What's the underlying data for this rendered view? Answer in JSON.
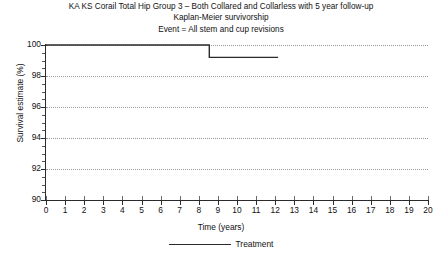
{
  "title": {
    "line1": "KA KS Corail Total Hip Group 3 – Both Collared and Collarless with 5 year follow-up",
    "line2": "Kaplan-Meier survivorship",
    "line3": "Event = All stem and cup revisions"
  },
  "legend": {
    "series_label": "Treatment"
  },
  "colors": {
    "curve": "#2b2b2b",
    "axis": "#2b2b2b",
    "grid": "#9a9a9a",
    "text": "#111111",
    "background": "#ffffff"
  },
  "chart_data": {
    "type": "line",
    "xlabel": "Time (years)",
    "ylabel": "Survival estimate (%)",
    "xlim": [
      0,
      20
    ],
    "ylim": [
      90,
      100
    ],
    "xticks": [
      0,
      1,
      2,
      3,
      4,
      5,
      6,
      7,
      8,
      9,
      10,
      11,
      12,
      13,
      14,
      15,
      16,
      17,
      18,
      19,
      20
    ],
    "xtick_labels": [
      "0",
      "1",
      "2",
      "3",
      "4",
      "5",
      "6",
      "7",
      "8",
      "9",
      "10",
      "11",
      "12",
      "13",
      "14",
      "15",
      "16",
      "17",
      "18",
      "19",
      "20"
    ],
    "yticks": [
      90,
      92,
      94,
      96,
      98,
      100
    ],
    "ytick_labels": [
      "90",
      "92",
      "94",
      "96",
      "98",
      "100"
    ],
    "y_minor_tick_step": 0.5,
    "grid": "horizontal-dotted",
    "legend_position": "bottom-center",
    "step_shape": "post",
    "series": [
      {
        "name": "Treatment",
        "x": [
          0,
          8.55,
          8.55,
          12.15
        ],
        "y": [
          100,
          100,
          99.2,
          99.2
        ]
      }
    ],
    "annotations": []
  }
}
